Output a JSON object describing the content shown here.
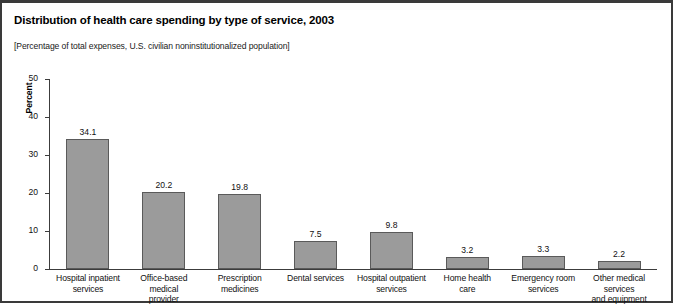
{
  "title": "Distribution of health care spending by type of service, 2003",
  "subtitle": "[Percentage of total expenses, U.S. civilian noninstitutionalized population]",
  "chart_data": {
    "type": "bar",
    "title": "Distribution of health care spending by type of service, 2003",
    "subtitle": "[Percentage of total expenses, U.S. civilian noninstitutionalized population]",
    "xlabel": "",
    "ylabel": "Percent",
    "ylim": [
      0,
      50
    ],
    "yticks": [
      0,
      10,
      20,
      30,
      40,
      50
    ],
    "ytick_labels": [
      "0",
      "10",
      "20",
      "30",
      "40",
      "50"
    ],
    "grid": false,
    "legend": false,
    "bar_color": "#9b9b9b",
    "bar_edge_color": "#5a5a5a",
    "categories": [
      "Hospital inpatient services",
      "Office-based medical provider",
      "Prescription medicines",
      "Dental services",
      "Hospital outpatient services",
      "Home health care",
      "Emergency room services",
      "Other medical services and equipment"
    ],
    "category_lines": [
      [
        "Hospital inpatient",
        "services"
      ],
      [
        "Office-based medical",
        "provider"
      ],
      [
        "Prescription",
        "medicines"
      ],
      [
        "Dental services"
      ],
      [
        "Hospital outpatient",
        "services"
      ],
      [
        "Home health",
        "care"
      ],
      [
        "Emergency room",
        "services"
      ],
      [
        "Other medical services",
        "and equipment"
      ]
    ],
    "values": [
      34.1,
      20.2,
      19.8,
      7.5,
      9.8,
      3.2,
      3.3,
      2.2
    ],
    "value_labels": [
      "34.1",
      "20.2",
      "19.8",
      "7.5",
      "9.8",
      "3.2",
      "3.3",
      "2.2"
    ]
  }
}
